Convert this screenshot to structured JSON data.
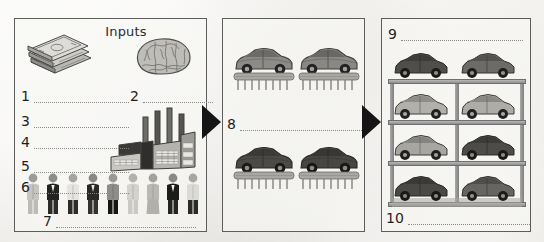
{
  "worksheet": {
    "background_color": "#eceae6",
    "border_color": "#5d5d5d",
    "arrow_color": "#151515"
  },
  "panels": [
    {
      "name": "inputs-panel",
      "title": "Inputs",
      "icons": [
        {
          "name": "money-icon",
          "label": "stack of banknotes"
        },
        {
          "name": "brain-icon",
          "label": "brain"
        },
        {
          "name": "factory-icon",
          "label": "factory with four smokestacks"
        },
        {
          "name": "people-icon",
          "label": "row of nine people"
        }
      ],
      "blanks": [
        {
          "number": "1",
          "answer": ""
        },
        {
          "number": "2",
          "answer": ""
        },
        {
          "number": "3",
          "answer": ""
        },
        {
          "number": "4",
          "answer": ""
        },
        {
          "number": "5",
          "answer": ""
        },
        {
          "number": "6",
          "answer": ""
        },
        {
          "number": "7",
          "answer": ""
        }
      ]
    },
    {
      "name": "production-panel",
      "title": "",
      "icons": [
        {
          "name": "car-on-assembly-line-icon",
          "label": "car on conveyor line"
        }
      ],
      "car_count": 4,
      "blanks": [
        {
          "number": "8",
          "answer": ""
        }
      ]
    },
    {
      "name": "output-storage-panel",
      "title": "",
      "icons": [
        {
          "name": "car-storage-rack-icon",
          "label": "four-tier car storage rack"
        }
      ],
      "rack": {
        "levels": 4,
        "columns": 2,
        "car_count": 8
      },
      "blanks": [
        {
          "number": "9",
          "answer": ""
        },
        {
          "number": "10",
          "answer": ""
        }
      ]
    }
  ],
  "arrows": [
    {
      "name": "arrow-inputs-to-production",
      "direction": "right"
    },
    {
      "name": "arrow-production-to-output",
      "direction": "right"
    }
  ],
  "people": [
    {
      "tone": "light"
    },
    {
      "tone": "dark"
    },
    {
      "tone": "light"
    },
    {
      "tone": "dark"
    },
    {
      "tone": "dark"
    },
    {
      "tone": "light"
    },
    {
      "tone": "light"
    },
    {
      "tone": "dark"
    },
    {
      "tone": "light"
    }
  ],
  "cars_line": [
    {
      "tone": "mid"
    },
    {
      "tone": "mid"
    },
    {
      "tone": "dark"
    },
    {
      "tone": "dark"
    }
  ],
  "cars_rack": [
    {
      "tone": "dark"
    },
    {
      "tone": "mid"
    },
    {
      "tone": "light"
    },
    {
      "tone": "light"
    },
    {
      "tone": "light"
    },
    {
      "tone": "dark"
    },
    {
      "tone": "dark"
    },
    {
      "tone": "mid"
    }
  ]
}
